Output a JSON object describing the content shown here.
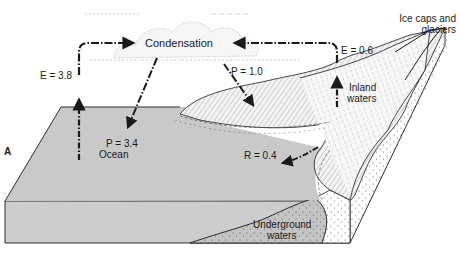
{
  "figure": {
    "panel_label": "A"
  },
  "labels": {
    "condensation": "Condensation",
    "evaporation_ocean": "E = 3.8",
    "precipitation_ocean": "P = 3.4",
    "ocean": "Ocean",
    "precipitation_land": "P = 1.0",
    "evaporation_land": "E = 0.6",
    "runoff": "R = 0.4",
    "inland_waters_line1": "Inland",
    "inland_waters_line2": "waters",
    "ice_caps_line1": "Ice caps and",
    "ice_caps_line2": "glaciers",
    "underground_line1": "Underground",
    "underground_line2": "waters"
  },
  "colors": {
    "ocean": "#c9c9c9",
    "ocean_front": "#cdcdcd",
    "line": "#1a1a1a",
    "land": "#f2f2f2",
    "background": "#ffffff"
  }
}
